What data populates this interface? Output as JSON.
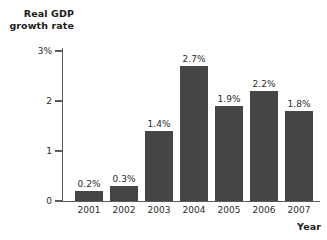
{
  "chart_data": {
    "type": "bar",
    "title": "",
    "xlabel": "Year",
    "ylabel": "Real GDP growth rate",
    "ylabel_lines": [
      "Real GDP",
      "growth rate"
    ],
    "categories": [
      "2001",
      "2002",
      "2003",
      "2004",
      "2005",
      "2006",
      "2007"
    ],
    "values": [
      0.2,
      0.3,
      1.4,
      2.7,
      1.9,
      2.2,
      1.8
    ],
    "value_labels": [
      "0.2%",
      "0.3%",
      "1.4%",
      "2.7%",
      "1.9%",
      "2.2%",
      "1.8%"
    ],
    "ylim": [
      0,
      3
    ],
    "yticks": [
      0,
      1,
      2,
      3
    ],
    "ytick_labels": [
      "0",
      "1",
      "2",
      "3%"
    ],
    "grid": false,
    "legend": null,
    "bar_color": "#454545",
    "axis_color": "#5c5c5c",
    "text_color": "#2b2b2b",
    "background": "#ffffff"
  }
}
